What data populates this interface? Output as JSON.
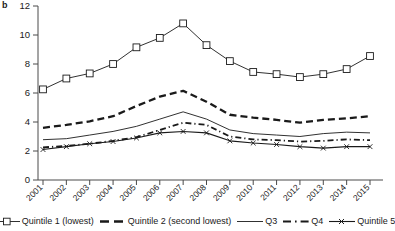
{
  "panel": {
    "label": "b"
  },
  "chart_data": {
    "type": "line",
    "title": "",
    "subtitle": "",
    "xlabel": "",
    "ylabel": "",
    "grid": false,
    "legend_position": "bottom",
    "xlim": [
      2001,
      2015
    ],
    "ylim": [
      0,
      12
    ],
    "ytick_step": 2,
    "categories": [
      "2001",
      "2002",
      "2003",
      "2004",
      "2005",
      "2006",
      "2007",
      "2008",
      "2009",
      "2010",
      "2011",
      "2012",
      "2013",
      "2014",
      "2015"
    ],
    "yticks": [
      "0",
      "2",
      "4",
      "6",
      "8",
      "10",
      "12"
    ],
    "series": [
      {
        "name": "Quintile 1 (lowest)",
        "style": "solid-square-marker",
        "marker": "open-square",
        "values": [
          6.25,
          7.0,
          7.35,
          8.0,
          9.15,
          9.8,
          10.8,
          9.3,
          8.2,
          7.45,
          7.3,
          7.1,
          7.3,
          7.65,
          8.55
        ]
      },
      {
        "name": "Quintile 2 (second lowest)",
        "style": "dashed-thick",
        "marker": "none",
        "values": [
          3.6,
          3.8,
          4.05,
          4.4,
          5.1,
          5.75,
          6.15,
          5.4,
          4.5,
          4.3,
          4.15,
          3.95,
          4.15,
          4.25,
          4.4
        ]
      },
      {
        "name": "Q3",
        "style": "solid-thin",
        "marker": "none",
        "values": [
          2.78,
          2.85,
          3.1,
          3.35,
          3.7,
          4.2,
          4.7,
          4.2,
          3.45,
          3.2,
          3.1,
          3.0,
          3.2,
          3.3,
          3.25
        ]
      },
      {
        "name": "Q4",
        "style": "dash-dot",
        "marker": "none",
        "values": [
          2.25,
          2.35,
          2.5,
          2.7,
          2.95,
          3.45,
          3.95,
          3.8,
          3.0,
          2.8,
          2.75,
          2.65,
          2.7,
          2.8,
          2.75
        ]
      },
      {
        "name": "Quintile 5",
        "style": "solid-x-marker",
        "marker": "x",
        "values": [
          2.1,
          2.3,
          2.5,
          2.65,
          2.9,
          3.25,
          3.35,
          3.25,
          2.7,
          2.55,
          2.45,
          2.3,
          2.2,
          2.3,
          2.3
        ]
      }
    ]
  },
  "legend": {
    "items": [
      {
        "label": "Quintile 1 (lowest)",
        "key": "line-open-square"
      },
      {
        "label": "Quintile 2 (second lowest)",
        "key": "line-dashed-thick"
      },
      {
        "label": "Q3",
        "key": "line-solid-thin"
      },
      {
        "label": "Q4",
        "key": "line-dash-dot"
      },
      {
        "label": "Quintile 5",
        "key": "line-x-marker"
      }
    ]
  },
  "colors": {
    "ink": "#1a1a1a",
    "axis": "#4a4a4a",
    "background": "#ffffff"
  }
}
